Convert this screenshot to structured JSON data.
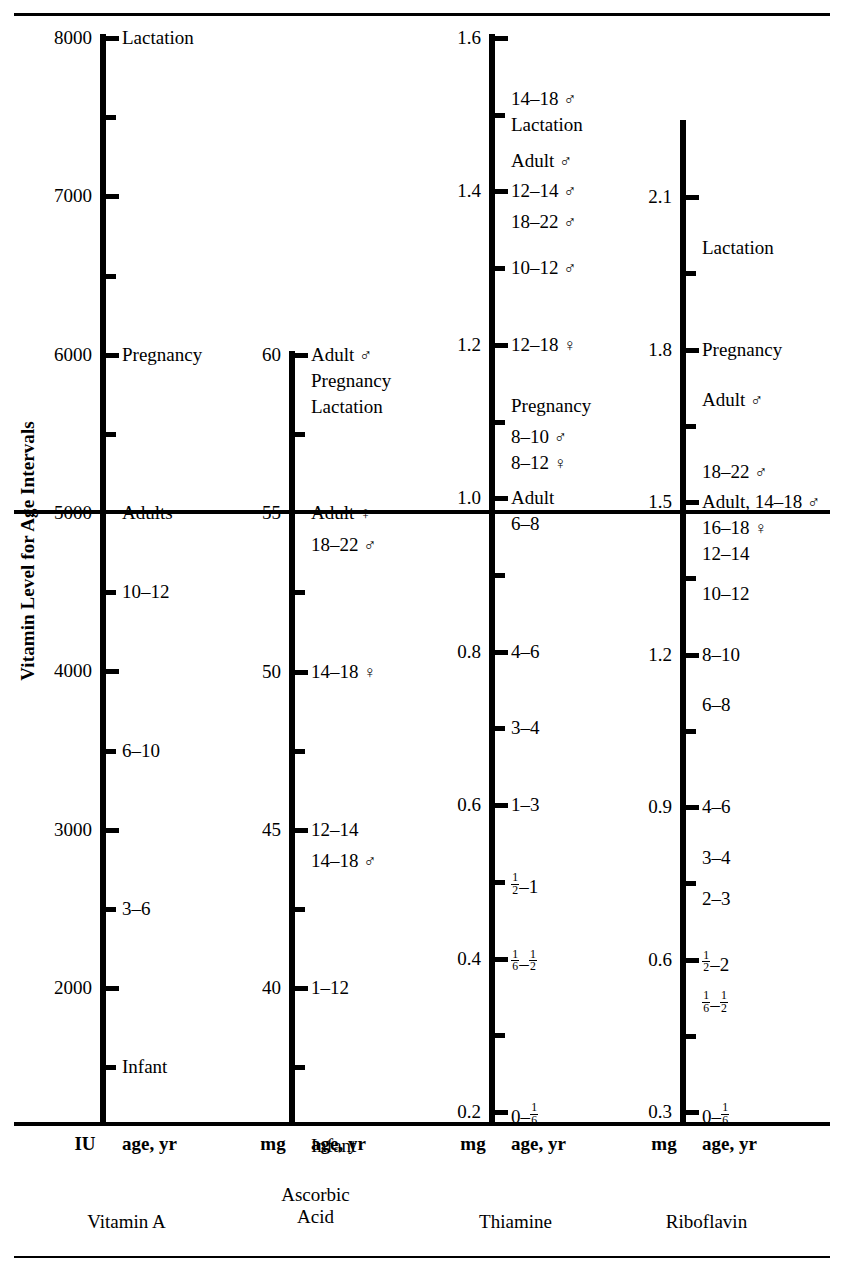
{
  "figure": {
    "y_axis_caption": "Vitamin Level for Age Intervals"
  },
  "columns": [
    {
      "id": "vitamin-a",
      "name": "Vitamin A",
      "unit": "IU",
      "age_header": "age, yr",
      "scale_ticks": [
        "8000",
        "7000",
        "6000",
        "5000",
        "4000",
        "3000",
        "2000"
      ],
      "entries": [
        {
          "value": "8000",
          "label": "Lactation"
        },
        {
          "value": "6000",
          "label": "Pregnancy"
        },
        {
          "value": "5000",
          "label": "Adults"
        },
        {
          "value": "4500",
          "label": "10–12"
        },
        {
          "value": "3500",
          "label": "6–10"
        },
        {
          "value": "2500",
          "label": "3–6"
        },
        {
          "value": "1500",
          "label": "Infant"
        }
      ]
    },
    {
      "id": "ascorbic-acid",
      "name": "Ascorbic Acid",
      "name_line1": "Ascorbic",
      "name_line2": "Acid",
      "unit": "mg",
      "age_header": "age, yr",
      "scale_ticks": [
        "60",
        "55",
        "50",
        "45",
        "40"
      ],
      "entries": [
        {
          "value": "60",
          "label": "Adult ♂"
        },
        {
          "value": "60",
          "label": "Pregnancy"
        },
        {
          "value": "60",
          "label": "Lactation"
        },
        {
          "value": "55",
          "label": "Adult ♀"
        },
        {
          "value": "54",
          "label": "18–22 ♂"
        },
        {
          "value": "50",
          "label": "14–18 ♀"
        },
        {
          "value": "45",
          "label": "12–14"
        },
        {
          "value": "44",
          "label": "14–18 ♂"
        },
        {
          "value": "40",
          "label": "1–12"
        },
        {
          "value": "35",
          "label": "Infant"
        }
      ]
    },
    {
      "id": "thiamine",
      "name": "Thiamine",
      "unit": "mg",
      "age_header": "age, yr",
      "scale_ticks": [
        "1.6",
        "1.4",
        "1.2",
        "1.0",
        "0.8",
        "0.6",
        "0.4",
        "0.2"
      ],
      "entries": [
        {
          "value": "1.52",
          "label": "14–18 ♂"
        },
        {
          "value": "1.50",
          "label": "Lactation"
        },
        {
          "value": "1.44",
          "label": "Adult ♂"
        },
        {
          "value": "1.40",
          "label": "12–14 ♂"
        },
        {
          "value": "1.36",
          "label": "18–22 ♂"
        },
        {
          "value": "1.30",
          "label": "10–12 ♂"
        },
        {
          "value": "1.20",
          "label": "12–18 ♀"
        },
        {
          "value": "1.12",
          "label": "Pregnancy"
        },
        {
          "value": "1.08",
          "label": "8–10 ♂"
        },
        {
          "value": "1.05",
          "label": "8–12 ♀"
        },
        {
          "value": "1.00",
          "label": "Adult"
        },
        {
          "value": "0.98",
          "label": "6–8"
        },
        {
          "value": "0.80",
          "label": "4–6"
        },
        {
          "value": "0.70",
          "label": "3–4"
        },
        {
          "value": "0.60",
          "label": "1–3"
        },
        {
          "value": "0.50",
          "label": "½–1",
          "frac": [
            "1/2",
            "-",
            "1"
          ]
        },
        {
          "value": "0.40",
          "label": "⅙–½",
          "frac": [
            "1/6",
            "-",
            "1/2"
          ]
        },
        {
          "value": "0.20",
          "label": "0–⅙",
          "frac": [
            "0",
            "-",
            "1/6"
          ]
        }
      ]
    },
    {
      "id": "riboflavin",
      "name": "Riboflavin",
      "unit": "mg",
      "age_header": "age, yr",
      "scale_ticks": [
        "2.1",
        "1.8",
        "1.5",
        "1.2",
        "0.9",
        "0.6",
        "0.3"
      ],
      "entries": [
        {
          "value": "2.00",
          "label": "Lactation"
        },
        {
          "value": "1.80",
          "label": "Pregnancy"
        },
        {
          "value": "1.70",
          "label": "Adult ♂"
        },
        {
          "value": "1.56",
          "label": "18–22 ♂"
        },
        {
          "value": "1.50",
          "label": "Adult, 14–18 ♂"
        },
        {
          "value": "1.48",
          "label": "16–18 ♀"
        },
        {
          "value": "1.40",
          "label": "12–14"
        },
        {
          "value": "1.32",
          "label": "10–12"
        },
        {
          "value": "1.20",
          "label": "8–10"
        },
        {
          "value": "1.10",
          "label": "6–8"
        },
        {
          "value": "0.90",
          "label": "4–6"
        },
        {
          "value": "0.80",
          "label": "3–4"
        },
        {
          "value": "0.72",
          "label": "2–3"
        },
        {
          "value": "0.60",
          "label": "½–2",
          "frac": [
            "1/2",
            "-",
            "2"
          ]
        },
        {
          "value": "0.52",
          "label": "⅙–½",
          "frac": [
            "1/6",
            "-",
            "1/2"
          ]
        },
        {
          "value": "0.30",
          "label": "0–⅙",
          "frac": [
            "0",
            "-",
            "1/6"
          ]
        }
      ]
    }
  ],
  "chart_data": {
    "type": "table",
    "ylabel": "Vitamin Level for Age Intervals",
    "grid": false,
    "legend": "none",
    "series": [
      {
        "name": "Vitamin A",
        "unit": "IU",
        "axis_ticks": [
          8000,
          7000,
          6000,
          5000,
          4000,
          3000,
          2000
        ],
        "axis_range": [
          1200,
          8000
        ],
        "points": [
          {
            "label": "Lactation",
            "value": 8000
          },
          {
            "label": "Pregnancy",
            "value": 6000
          },
          {
            "label": "Adults",
            "value": 5000
          },
          {
            "label": "10–12",
            "value": 4500
          },
          {
            "label": "6–10",
            "value": 3500
          },
          {
            "label": "3–6",
            "value": 2500
          },
          {
            "label": "Infant",
            "value": 1500
          }
        ]
      },
      {
        "name": "Ascorbic Acid",
        "unit": "mg",
        "axis_ticks": [
          60,
          55,
          50,
          45,
          40
        ],
        "axis_range": [
          34,
          60
        ],
        "points": [
          {
            "label": "Adult ♂",
            "value": 60
          },
          {
            "label": "Pregnancy",
            "value": 60
          },
          {
            "label": "Lactation",
            "value": 60
          },
          {
            "label": "Adult ♀",
            "value": 55
          },
          {
            "label": "18–22 ♂",
            "value": 54
          },
          {
            "label": "14–18 ♀",
            "value": 50
          },
          {
            "label": "12–14",
            "value": 45
          },
          {
            "label": "14–18 ♂",
            "value": 44
          },
          {
            "label": "1–12",
            "value": 40
          },
          {
            "label": "Infant",
            "value": 35
          }
        ]
      },
      {
        "name": "Thiamine",
        "unit": "mg",
        "axis_ticks": [
          1.6,
          1.4,
          1.2,
          1.0,
          0.8,
          0.6,
          0.4,
          0.2
        ],
        "axis_range": [
          0.18,
          1.6
        ],
        "points": [
          {
            "label": "14–18 ♂",
            "value": 1.52
          },
          {
            "label": "Lactation",
            "value": 1.5
          },
          {
            "label": "Adult ♂",
            "value": 1.44
          },
          {
            "label": "12–14 ♂",
            "value": 1.4
          },
          {
            "label": "18–22 ♂",
            "value": 1.36
          },
          {
            "label": "10–12 ♂",
            "value": 1.3
          },
          {
            "label": "12–18 ♀",
            "value": 1.2
          },
          {
            "label": "Pregnancy",
            "value": 1.12
          },
          {
            "label": "8–10 ♂",
            "value": 1.08
          },
          {
            "label": "8–12 ♀",
            "value": 1.05
          },
          {
            "label": "Adult",
            "value": 1.0
          },
          {
            "label": "6–8",
            "value": 0.98
          },
          {
            "label": "4–6",
            "value": 0.8
          },
          {
            "label": "3–4",
            "value": 0.7
          },
          {
            "label": "1–3",
            "value": 0.6
          },
          {
            "label": "½–1",
            "value": 0.5
          },
          {
            "label": "⅙–½",
            "value": 0.4
          },
          {
            "label": "0–⅙",
            "value": 0.2
          }
        ]
      },
      {
        "name": "Riboflavin",
        "unit": "mg",
        "axis_ticks": [
          2.1,
          1.8,
          1.5,
          1.2,
          0.9,
          0.6,
          0.3
        ],
        "axis_range": [
          0.28,
          2.25
        ],
        "points": [
          {
            "label": "Lactation",
            "value": 2.0
          },
          {
            "label": "Pregnancy",
            "value": 1.8
          },
          {
            "label": "Adult ♂",
            "value": 1.7
          },
          {
            "label": "18–22 ♂",
            "value": 1.56
          },
          {
            "label": "Adult, 14–18 ♂",
            "value": 1.5
          },
          {
            "label": "16–18 ♀",
            "value": 1.48
          },
          {
            "label": "12–14",
            "value": 1.4
          },
          {
            "label": "10–12",
            "value": 1.32
          },
          {
            "label": "8–10",
            "value": 1.2
          },
          {
            "label": "6–8",
            "value": 1.1
          },
          {
            "label": "4–6",
            "value": 0.9
          },
          {
            "label": "3–4",
            "value": 0.8
          },
          {
            "label": "2–3",
            "value": 0.72
          },
          {
            "label": "½–2",
            "value": 0.6
          },
          {
            "label": "⅙–½",
            "value": 0.52
          },
          {
            "label": "0–⅙",
            "value": 0.3
          }
        ]
      }
    ]
  }
}
